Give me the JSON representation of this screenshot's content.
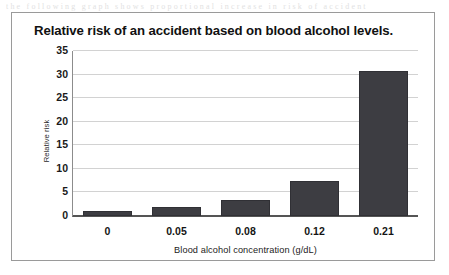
{
  "scan_artifact_text": "the  following  graph  shows  proportional  increase  in  risk  of  accident",
  "chart_data": {
    "type": "bar",
    "title": "Relative risk of an accident based on blood alcohol levels.",
    "xlabel": "Blood alcohol concentration (g/dL)",
    "ylabel": "Relative risk",
    "categories": [
      "0",
      "0.05",
      "0.08",
      "0.12",
      "0.21"
    ],
    "values": [
      1.0,
      2.0,
      3.5,
      7.5,
      30.8
    ],
    "ylim": [
      0,
      35
    ],
    "yticks": [
      0,
      5,
      10,
      15,
      20,
      25,
      30,
      35
    ],
    "ytick_labels": [
      "0",
      "5",
      "10",
      "15",
      "20",
      "25",
      "30",
      "35"
    ],
    "grid": true,
    "legend": false,
    "bar_color": "#3d3d42",
    "plot_background": "#ffffff",
    "frame_color": "#9a9a9a",
    "gridline_color": "#d2d2d2"
  }
}
